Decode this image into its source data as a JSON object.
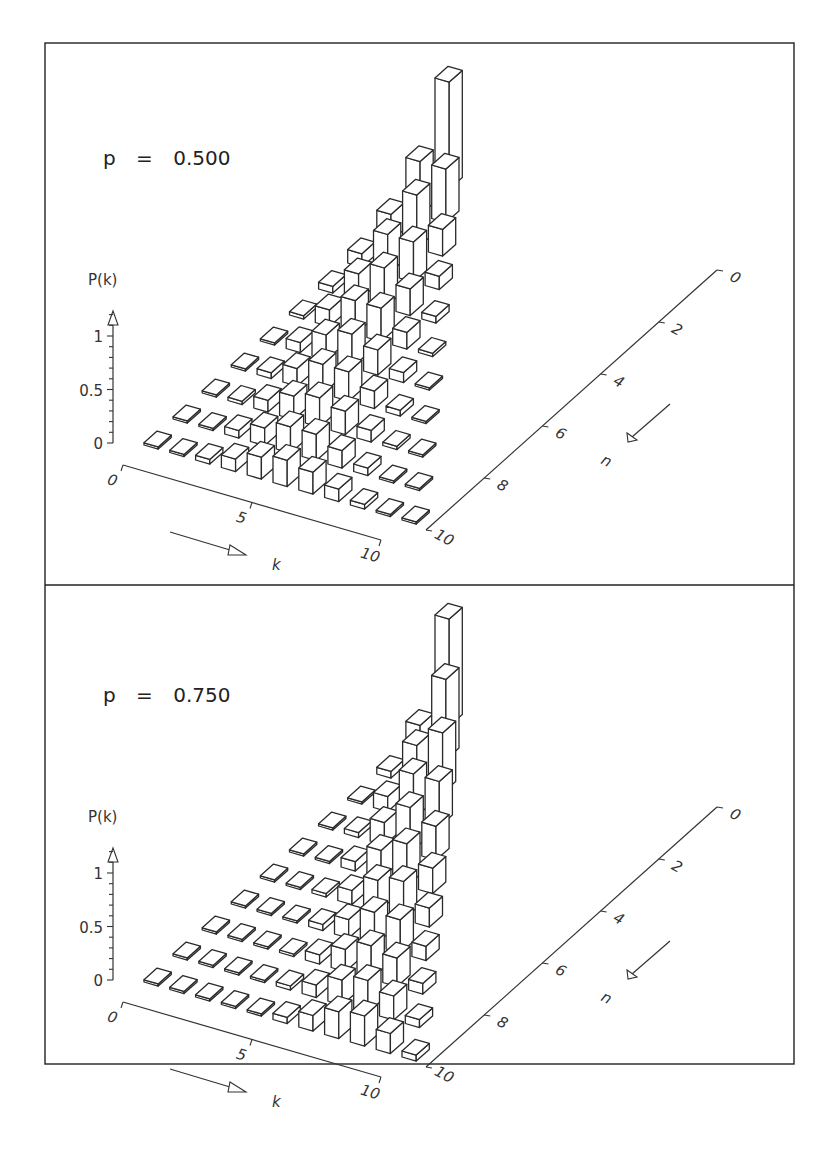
{
  "figure": {
    "panels": [
      {
        "label_prefix": "p",
        "label_equals": "=",
        "p_text": "0.500"
      },
      {
        "label_prefix": "p",
        "label_equals": "=",
        "p_text": "0.750"
      }
    ],
    "z_axis": {
      "label": "P(k)",
      "ticks": [
        "0",
        "0.5",
        "1"
      ]
    },
    "k_axis": {
      "label": "k",
      "ticks": [
        "0",
        "5",
        "10"
      ]
    },
    "n_axis": {
      "label": "n",
      "ticks": [
        "0",
        "2",
        "4",
        "6",
        "8",
        "10"
      ]
    },
    "colors": {
      "stroke": "#2a2a2a",
      "background": "#ffffff"
    }
  },
  "chart_data": [
    {
      "type": "bar3d",
      "title": "p = 0.500",
      "xlabel": "k",
      "ylabel": "n",
      "zlabel": "P(k)",
      "x_ticks": [
        0,
        5,
        10
      ],
      "y_ticks": [
        0,
        2,
        4,
        6,
        8,
        10
      ],
      "z_ticks": [
        0,
        0.5,
        1
      ],
      "zlim": [
        0,
        1.2
      ],
      "p": 0.5,
      "rows": [
        {
          "n": 0,
          "values": [
            1
          ]
        },
        {
          "n": 1,
          "values": [
            0.5,
            0.5
          ]
        },
        {
          "n": 2,
          "values": [
            0.25,
            0.5,
            0.25
          ]
        },
        {
          "n": 3,
          "values": [
            0.125,
            0.375,
            0.375,
            0.125
          ]
        },
        {
          "n": 4,
          "values": [
            0.0625,
            0.25,
            0.375,
            0.25,
            0.0625
          ]
        },
        {
          "n": 5,
          "values": [
            0.0313,
            0.1563,
            0.3125,
            0.3125,
            0.1563,
            0.0313
          ]
        },
        {
          "n": 6,
          "values": [
            0.0156,
            0.0938,
            0.2344,
            0.3125,
            0.2344,
            0.0938,
            0.0156
          ]
        },
        {
          "n": 7,
          "values": [
            0.0078,
            0.0547,
            0.1641,
            0.2734,
            0.2734,
            0.1641,
            0.0547,
            0.0078
          ]
        },
        {
          "n": 8,
          "values": [
            0.0039,
            0.0313,
            0.1094,
            0.2188,
            0.2734,
            0.2188,
            0.1094,
            0.0313,
            0.0039
          ]
        },
        {
          "n": 9,
          "values": [
            0.002,
            0.0176,
            0.0703,
            0.1641,
            0.2461,
            0.2461,
            0.1641,
            0.0703,
            0.0176,
            0.002
          ]
        },
        {
          "n": 10,
          "values": [
            0.001,
            0.0098,
            0.0439,
            0.1172,
            0.2051,
            0.2461,
            0.2051,
            0.1172,
            0.0439,
            0.0098,
            0.001
          ]
        }
      ]
    },
    {
      "type": "bar3d",
      "title": "p = 0.750",
      "xlabel": "k",
      "ylabel": "n",
      "zlabel": "P(k)",
      "x_ticks": [
        0,
        5,
        10
      ],
      "y_ticks": [
        0,
        2,
        4,
        6,
        8,
        10
      ],
      "z_ticks": [
        0,
        0.5,
        1
      ],
      "zlim": [
        0,
        1.2
      ],
      "p": 0.75,
      "rows": [
        {
          "n": 0,
          "values": [
            1
          ]
        },
        {
          "n": 1,
          "values": [
            0.25,
            0.75
          ]
        },
        {
          "n": 2,
          "values": [
            0.0625,
            0.375,
            0.5625
          ]
        },
        {
          "n": 3,
          "values": [
            0.0156,
            0.1406,
            0.4219,
            0.4219
          ]
        },
        {
          "n": 4,
          "values": [
            0.0039,
            0.0469,
            0.2109,
            0.4219,
            0.3164
          ]
        },
        {
          "n": 5,
          "values": [
            0.001,
            0.0146,
            0.0879,
            0.2637,
            0.3955,
            0.2373
          ]
        },
        {
          "n": 6,
          "values": [
            0.0002,
            0.0044,
            0.033,
            0.1318,
            0.2966,
            0.356,
            0.178
          ]
        },
        {
          "n": 7,
          "values": [
            0.0001,
            0.0013,
            0.0115,
            0.0577,
            0.173,
            0.3115,
            0.3115,
            0.1335
          ]
        },
        {
          "n": 8,
          "values": [
            0.0,
            0.0004,
            0.0038,
            0.0231,
            0.0865,
            0.2076,
            0.3115,
            0.267,
            0.1001
          ]
        },
        {
          "n": 9,
          "values": [
            0.0,
            0.0001,
            0.0012,
            0.0087,
            0.0389,
            0.1168,
            0.2336,
            0.3003,
            0.2253,
            0.0751
          ]
        },
        {
          "n": 10,
          "values": [
            0.0,
            0.0,
            0.0004,
            0.0031,
            0.0162,
            0.0584,
            0.146,
            0.2503,
            0.2816,
            0.1877,
            0.0563
          ]
        }
      ]
    }
  ]
}
